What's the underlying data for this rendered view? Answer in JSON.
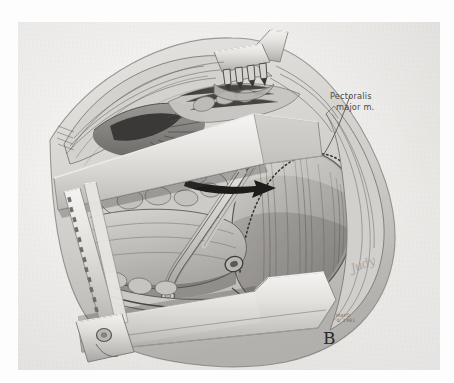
{
  "plate": {
    "kind": "surgical-anatomical-illustration",
    "medium": "graphite / wash drawing, grayscale",
    "panel_letter": "B",
    "subject": "Exposure of the infraclavicular axillary vessels with self-retaining retractor in place",
    "background_color": "#f2f1ef",
    "ink_color": "#3b3b3b"
  },
  "annotations": {
    "pectoralis": {
      "line1": "Pectoralis",
      "line2": "major m.",
      "leader": "line from label down-left to the muscle belly"
    },
    "panel_label": "B",
    "credit": {
      "line1": "MAYO",
      "line2": "© 1981"
    },
    "signature": "Judy"
  },
  "instruments": [
    {
      "name": "rake-retractor",
      "prongs": 4,
      "location": "top-center"
    },
    {
      "name": "retractor-blade-upper",
      "location": "upper-middle, diagonal"
    },
    {
      "name": "retractor-blade-lower",
      "location": "lower-middle, diagonal"
    },
    {
      "name": "retractor-rack-bar",
      "location": "left edge, toothed ratchet"
    },
    {
      "name": "retractor-frame-side",
      "location": "left vertical arm"
    },
    {
      "name": "thumbscrew",
      "location": "lower-left of frame"
    }
  ],
  "anatomy": [
    {
      "name": "pectoralis-major-muscle",
      "location": "right of field, striated"
    },
    {
      "name": "divided-muscle-edge",
      "location": "dotted incision margin"
    },
    {
      "name": "axillary-vein",
      "location": "center, pale tubular"
    },
    {
      "name": "fat-lobules",
      "location": "left-center, lobulated"
    },
    {
      "name": "skin-flap-edge",
      "location": "upper left, everted"
    },
    {
      "name": "vessel-stump",
      "location": "center-bottom, small ring"
    }
  ],
  "markers": [
    {
      "name": "dissection-arrow",
      "style": "solid black arrow pointing right",
      "location": "center-upper"
    },
    {
      "name": "pectoralis-leader-arrow",
      "style": "thin arrow",
      "location": "right-upper"
    }
  ]
}
